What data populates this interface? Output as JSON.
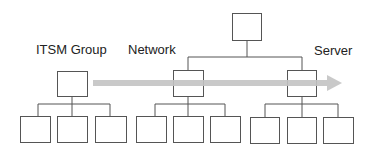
{
  "diagram": {
    "labels": {
      "itsm": "ITSM Group",
      "network": "Network",
      "server": "Server"
    },
    "colors": {
      "line": "#555555",
      "arrow": "#c8c8c8",
      "background": "#ffffff"
    },
    "arrow": {
      "direction": "right",
      "from": "ITSM Group",
      "to": "Server"
    }
  }
}
